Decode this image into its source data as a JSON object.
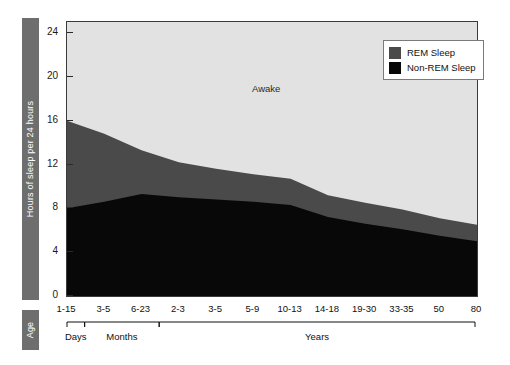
{
  "chart_data": {
    "type": "area",
    "title": "",
    "xlabel": "Age",
    "ylabel": "Hours of sleep per 24 hours",
    "ylim": [
      0,
      25
    ],
    "yticks": [
      0,
      4,
      8,
      12,
      16,
      20,
      24
    ],
    "grid": false,
    "stacked": true,
    "legend_position": "top-right",
    "categories": [
      "1-15",
      "3-5",
      "6-23",
      "2-3",
      "3-5",
      "5-9",
      "10-13",
      "14-18",
      "19-30",
      "33-35",
      "50",
      "80"
    ],
    "group_brackets": [
      {
        "label": "Days",
        "categories": [
          "1-15"
        ]
      },
      {
        "label": "Months",
        "categories": [
          "3-5",
          "6-23"
        ]
      },
      {
        "label": "Years",
        "categories": [
          "2-3",
          "3-5",
          "5-9",
          "10-13",
          "14-18",
          "19-30",
          "33-35",
          "50",
          "80"
        ]
      }
    ],
    "series": [
      {
        "name": "Non-REM Sleep",
        "color": "#080808",
        "values": [
          8.0,
          8.6,
          9.3,
          9.0,
          8.8,
          8.6,
          8.3,
          7.2,
          6.6,
          6.1,
          5.5,
          5.0
        ]
      },
      {
        "name": "REM Sleep",
        "color": "#4a4a4a",
        "values": [
          8.0,
          6.2,
          4.0,
          3.2,
          2.8,
          2.5,
          2.4,
          2.0,
          1.9,
          1.8,
          1.6,
          1.5
        ]
      },
      {
        "name": "Awake",
        "color": "#e2e2e2",
        "values": [
          8.0,
          9.2,
          10.7,
          11.8,
          12.4,
          12.9,
          13.3,
          14.8,
          15.5,
          16.1,
          16.9,
          17.5
        ]
      }
    ],
    "annotations": [
      {
        "text": "Awake",
        "x": "5-9",
        "y": 19
      }
    ]
  },
  "legend": {
    "items": [
      {
        "label": "REM Sleep",
        "color": "#4a4a4a"
      },
      {
        "label": "Non-REM Sleep",
        "color": "#080808"
      }
    ]
  },
  "axes": {
    "y_axis_title": "Hours of sleep per 24 hours",
    "x_axis_title": "Age",
    "y_tick_labels": [
      "0",
      "4",
      "8",
      "12",
      "16",
      "20",
      "24"
    ],
    "x_tick_labels": [
      "1-15",
      "3-5",
      "6-23",
      "2-3",
      "3-5",
      "5-9",
      "10-13",
      "14-18",
      "19-30",
      "33-35",
      "50",
      "80"
    ],
    "group_labels": [
      "Days",
      "Months",
      "Years"
    ]
  },
  "colors": {
    "awake": "#e2e2e2",
    "rem": "#4a4a4a",
    "non_rem": "#080808",
    "side_box": "#6e6e6e",
    "frame": "#3b3b3b"
  }
}
